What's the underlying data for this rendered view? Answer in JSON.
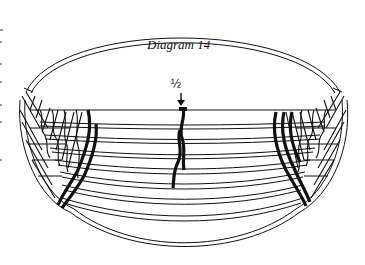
{
  "diagram": {
    "title": "Diagram 14",
    "marker_label": "½",
    "marker_arrow": "down-arrow",
    "colors": {
      "ink": "#111111",
      "background": "#ffffff"
    }
  }
}
